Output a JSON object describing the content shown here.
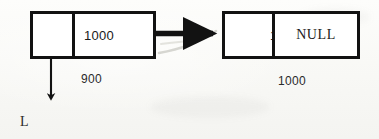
{
  "diagram": {
    "background_color": "#fbfbf9",
    "ink_color": "#121212",
    "artifact_color": "#c9c9c4",
    "head_pointer_label": "L",
    "nodes": [
      {
        "id": "node-1",
        "address_label": "900",
        "pointer_cell_value": "",
        "data_cell_value": "1000"
      },
      {
        "id": "node-2",
        "address_label": "1000",
        "pointer_cell_value": "10",
        "data_cell_value": "NULL"
      }
    ],
    "links": [
      {
        "id": "next-pointer-arrow",
        "from": "node-1",
        "to": "node-2",
        "style": "solid-bold"
      },
      {
        "id": "head-pointer-arrow",
        "from": "node-1",
        "to": "L",
        "style": "solid-thin"
      },
      {
        "id": "scan-artifact-streak",
        "style": "faint-diagonal"
      }
    ]
  }
}
